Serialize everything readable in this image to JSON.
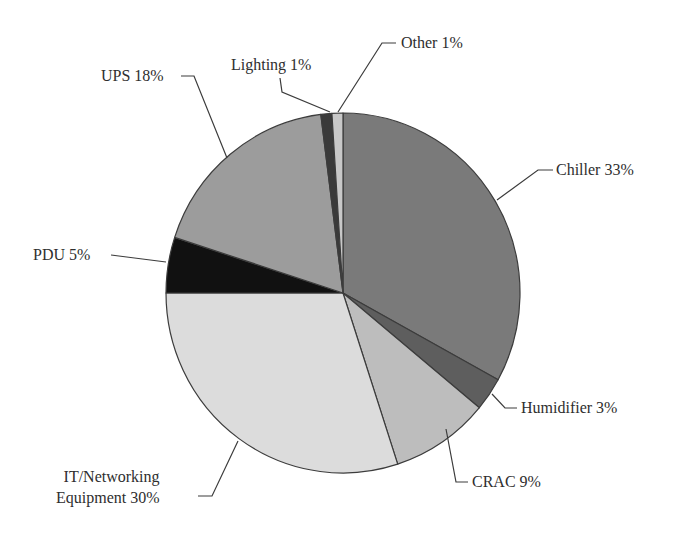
{
  "chart_data": {
    "type": "pie",
    "title": "",
    "start_angle_deg": 0,
    "direction": "clockwise",
    "slices": [
      {
        "name": "Chiller",
        "value": 33,
        "label": "Chiller 33%",
        "color": "#7a7a7a"
      },
      {
        "name": "Humidifier",
        "value": 3,
        "label": "Humidifier 3%",
        "color": "#5e5e5e"
      },
      {
        "name": "CRAC",
        "value": 9,
        "label": "CRAC 9%",
        "color": "#bdbdbd"
      },
      {
        "name": "IT/Networking Equipment",
        "value": 30,
        "label": "IT/Networking\nEquipment 30%",
        "color": "#dcdcdc"
      },
      {
        "name": "PDU",
        "value": 5,
        "label": "PDU 5%",
        "color": "#111111"
      },
      {
        "name": "UPS",
        "value": 18,
        "label": "UPS 18%",
        "color": "#9c9c9c"
      },
      {
        "name": "Lighting",
        "value": 1,
        "label": "Lighting 1%",
        "color": "#3a3a3a"
      },
      {
        "name": "Other",
        "value": 1,
        "label": "Other 1%",
        "color": "#c8c8c8"
      }
    ],
    "categories": [
      "Chiller",
      "Humidifier",
      "CRAC",
      "IT/Networking Equipment",
      "PDU",
      "UPS",
      "Lighting",
      "Other"
    ],
    "values": [
      33,
      3,
      9,
      30,
      5,
      18,
      1,
      1
    ],
    "units": "%",
    "legend": "none (leader-line labels)"
  },
  "labels": {
    "chiller": "Chiller 33%",
    "humidifier": "Humidifier 3%",
    "crac": "CRAC 9%",
    "it": "IT/Networking\nEquipment 30%",
    "pdu": "PDU 5%",
    "ups": "UPS 18%",
    "lighting": "Lighting 1%",
    "other": "Other 1%"
  },
  "style": {
    "outline_color": "#3c3c3c",
    "leader_color": "#3c3c3c"
  }
}
